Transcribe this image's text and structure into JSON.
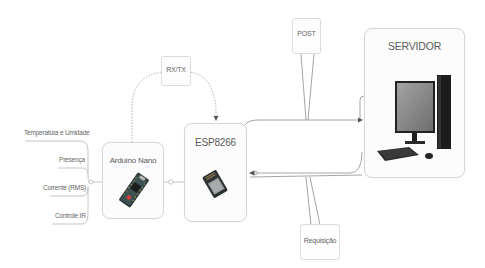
{
  "diagram": {
    "sensors": [
      {
        "label": "Temperatura e Umidade"
      },
      {
        "label": "Presença"
      },
      {
        "label": "Corrente (RMS)"
      },
      {
        "label": "Controle IR"
      }
    ],
    "nodes": {
      "arduino": {
        "label": "Arduino Nano",
        "icon": "arduino-nano-board"
      },
      "esp": {
        "label": "ESP8266",
        "icon": "esp8266-module"
      },
      "server": {
        "label": "SERVIDOR",
        "icon": "desktop-computer"
      }
    },
    "tags": {
      "rxtx": {
        "label": "RX/TX"
      },
      "post": {
        "label": "POST"
      },
      "requisicao": {
        "label": "Requisição"
      }
    },
    "edges": [
      {
        "from": "sensors",
        "to": "Arduino Nano"
      },
      {
        "from": "Arduino Nano",
        "to": "ESP8266",
        "label": "RX/TX",
        "style": "dashed"
      },
      {
        "from": "Arduino Nano",
        "to": "ESP8266",
        "style": "solid"
      },
      {
        "from": "ESP8266",
        "to": "SERVIDOR",
        "label": "POST"
      },
      {
        "from": "SERVIDOR",
        "to": "ESP8266",
        "label": "Requisição"
      }
    ],
    "colors": {
      "line": "#9a9a9a",
      "box_border": "#d6d6d6",
      "text": "#5a5a5a"
    }
  }
}
